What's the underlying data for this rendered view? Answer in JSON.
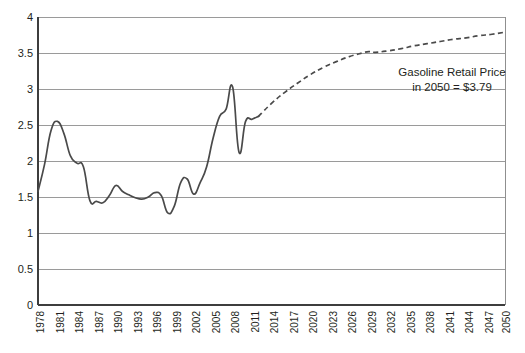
{
  "chart_data": {
    "type": "line",
    "title": "",
    "xlabel": "",
    "ylabel": "",
    "xlim": [
      1978,
      2050
    ],
    "ylim": [
      0,
      4
    ],
    "yticks": [
      "0",
      "0.5",
      "1",
      "1.5",
      "2",
      "2.5",
      "3",
      "3.5",
      "4"
    ],
    "ytick_values": [
      0,
      0.5,
      1,
      1.5,
      2,
      2.5,
      3,
      3.5,
      4
    ],
    "xticks": [
      "1978",
      "1981",
      "1984",
      "1987",
      "1990",
      "1993",
      "1996",
      "1999",
      "2002",
      "2005",
      "2008",
      "2011",
      "2014",
      "2017",
      "2020",
      "2023",
      "2026",
      "2029",
      "2032",
      "2035",
      "2038",
      "2041",
      "2044",
      "2047",
      "2050"
    ],
    "xtick_values": [
      1978,
      1981,
      1984,
      1987,
      1990,
      1993,
      1996,
      1999,
      2002,
      2005,
      2008,
      2011,
      2014,
      2017,
      2020,
      2023,
      2026,
      2029,
      2032,
      2035,
      2038,
      2041,
      2044,
      2047,
      2050
    ],
    "grid": "horizontal",
    "legend": "none",
    "annotations": [
      {
        "name": "forecast-callout",
        "line1": "Gasoline Retail Price",
        "line2": "in 2050 = $3.79"
      }
    ],
    "series": [
      {
        "name": "Gasoline Retail Price (historical)",
        "style": "solid",
        "color": "#4a4a4a",
        "x": [
          1978,
          1979,
          1980,
          1981,
          1982,
          1983,
          1984,
          1985,
          1986,
          1987,
          1988,
          1989,
          1990,
          1991,
          1992,
          1993,
          1994,
          1995,
          1996,
          1997,
          1998,
          1999,
          2000,
          2001,
          2002,
          2003,
          2004,
          2005,
          2006,
          2007,
          2008,
          2009,
          2010,
          2011,
          2012
        ],
        "y": [
          1.58,
          1.95,
          2.42,
          2.55,
          2.38,
          2.07,
          1.97,
          1.92,
          1.45,
          1.44,
          1.42,
          1.52,
          1.66,
          1.58,
          1.53,
          1.49,
          1.47,
          1.5,
          1.56,
          1.52,
          1.28,
          1.37,
          1.7,
          1.75,
          1.54,
          1.7,
          1.92,
          2.32,
          2.62,
          2.72,
          3.03,
          2.12,
          2.55,
          2.58,
          2.62
        ]
      },
      {
        "name": "Gasoline Retail Price (forecast)",
        "style": "dashed",
        "color": "#4a4a4a",
        "x": [
          2012,
          2014,
          2016,
          2018,
          2020,
          2022,
          2024,
          2026,
          2028,
          2029,
          2030,
          2032,
          2034,
          2036,
          2038,
          2040,
          2042,
          2044,
          2046,
          2048,
          2050
        ],
        "y": [
          2.62,
          2.8,
          2.95,
          3.08,
          3.2,
          3.3,
          3.38,
          3.45,
          3.5,
          3.52,
          3.51,
          3.53,
          3.56,
          3.6,
          3.63,
          3.66,
          3.69,
          3.71,
          3.74,
          3.76,
          3.79
        ]
      }
    ],
    "final_value": 3.79,
    "final_year": 2050
  }
}
